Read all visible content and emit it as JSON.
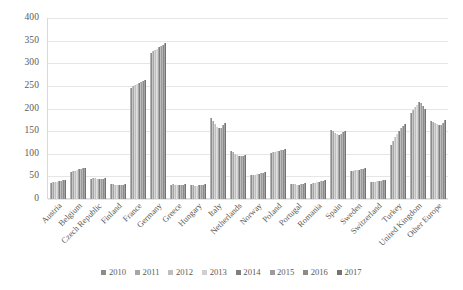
{
  "chart_data": {
    "type": "bar",
    "title": "",
    "subtitle": "",
    "xlabel": "",
    "ylabel": "",
    "ylim": [
      0,
      400
    ],
    "ytick_step": 50,
    "yticks": [
      "0",
      "50",
      "100",
      "150",
      "200",
      "250",
      "300",
      "350",
      "400"
    ],
    "grid": true,
    "legend_position": "bottom",
    "orientation": "vertical",
    "categories": [
      "Austria",
      "Belgium",
      "Czech Republic",
      "Finland",
      "France",
      "Germany",
      "Greece",
      "Hungary",
      "Italy",
      "Netherlands",
      "Norway",
      "Poland",
      "Portugal",
      "Romania",
      "Spain",
      "Sweden",
      "Switzerland",
      "Turkey",
      "United Kingdom",
      "Other Europe"
    ],
    "series": [
      {
        "name": "2010",
        "color": "#8c8c8c",
        "values": [
          36,
          60,
          45,
          34,
          246,
          323,
          32,
          31,
          178,
          106,
          52,
          101,
          33,
          34,
          152,
          62,
          37,
          120,
          190,
          172
        ]
      },
      {
        "name": "2011",
        "color": "#a6a6a6",
        "values": [
          37,
          62,
          46,
          33,
          250,
          327,
          33,
          30,
          172,
          103,
          53,
          104,
          34,
          35,
          150,
          63,
          38,
          128,
          196,
          170
        ]
      },
      {
        "name": "2012",
        "color": "#bfbfbf",
        "values": [
          37,
          63,
          46,
          32,
          252,
          330,
          31,
          29,
          166,
          100,
          54,
          105,
          33,
          36,
          146,
          64,
          38,
          136,
          203,
          168
        ]
      },
      {
        "name": "2013",
        "color": "#d0d0d0",
        "values": [
          38,
          64,
          45,
          32,
          254,
          332,
          30,
          29,
          160,
          97,
          55,
          106,
          32,
          37,
          143,
          64,
          39,
          143,
          208,
          166
        ]
      },
      {
        "name": "2014",
        "color": "#7f7f7f",
        "values": [
          39,
          66,
          44,
          31,
          257,
          335,
          30,
          30,
          156,
          95,
          56,
          107,
          32,
          38,
          142,
          65,
          39,
          150,
          214,
          164
        ]
      },
      {
        "name": "2015",
        "color": "#9c9c9c",
        "values": [
          40,
          67,
          44,
          31,
          259,
          338,
          31,
          31,
          158,
          94,
          57,
          108,
          33,
          39,
          144,
          66,
          40,
          156,
          213,
          163
        ]
      },
      {
        "name": "2016",
        "color": "#8a8a8a",
        "values": [
          41,
          68,
          45,
          32,
          261,
          341,
          32,
          32,
          163,
          95,
          58,
          109,
          34,
          40,
          147,
          67,
          41,
          161,
          205,
          167
        ]
      },
      {
        "name": "2017",
        "color": "#737373",
        "values": [
          42,
          69,
          46,
          33,
          264,
          344,
          33,
          33,
          168,
          97,
          59,
          110,
          35,
          41,
          150,
          68,
          42,
          165,
          198,
          174
        ]
      }
    ]
  },
  "legend": {
    "items": [
      {
        "label": "2010"
      },
      {
        "label": "2011"
      },
      {
        "label": "2012"
      },
      {
        "label": "2013"
      },
      {
        "label": "2014"
      },
      {
        "label": "2015"
      },
      {
        "label": "2016"
      },
      {
        "label": "2017"
      }
    ]
  },
  "colors": {
    "gridline": "#e6e6e6",
    "axis": "#d9d9d9",
    "text": "#5a5a5a",
    "background": "#ffffff"
  }
}
